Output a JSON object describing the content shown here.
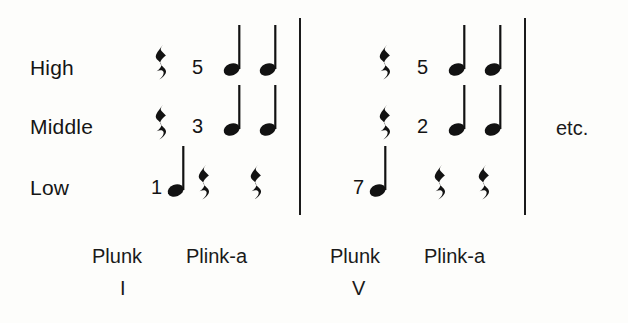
{
  "diagram": {
    "type": "music-notation-accompaniment-pattern",
    "voice_labels": [
      {
        "text": "High",
        "x": 30,
        "y": 57
      },
      {
        "text": "Middle",
        "x": 30,
        "y": 116
      },
      {
        "text": "Low",
        "x": 30,
        "y": 177
      }
    ],
    "measures": [
      {
        "index": 1,
        "chord": "I",
        "rows": [
          {
            "voice": "High",
            "symbols": [
              {
                "kind": "rest",
                "x": 153,
                "y": 44
              },
              {
                "kind": "degree",
                "text": "5",
                "x": 192,
                "y": 57
              },
              {
                "kind": "note",
                "x": 222,
                "y": 25
              },
              {
                "kind": "note",
                "x": 258,
                "y": 25
              }
            ]
          },
          {
            "voice": "Middle",
            "symbols": [
              {
                "kind": "rest",
                "x": 153,
                "y": 104
              },
              {
                "kind": "degree",
                "text": "3",
                "x": 192,
                "y": 116
              },
              {
                "kind": "note",
                "x": 222,
                "y": 85
              },
              {
                "kind": "note",
                "x": 258,
                "y": 85
              }
            ]
          },
          {
            "voice": "Low",
            "symbols": [
              {
                "kind": "degree",
                "text": "1",
                "x": 151,
                "y": 177
              },
              {
                "kind": "note",
                "x": 166,
                "y": 146
              },
              {
                "kind": "rest",
                "x": 196,
                "y": 164
              },
              {
                "kind": "rest",
                "x": 248,
                "y": 164
              }
            ]
          }
        ]
      },
      {
        "index": 2,
        "chord": "V",
        "rows": [
          {
            "voice": "High",
            "symbols": [
              {
                "kind": "rest",
                "x": 377,
                "y": 44
              },
              {
                "kind": "degree",
                "text": "5",
                "x": 417,
                "y": 57
              },
              {
                "kind": "note",
                "x": 447,
                "y": 25
              },
              {
                "kind": "note",
                "x": 483,
                "y": 25
              }
            ]
          },
          {
            "voice": "Middle",
            "symbols": [
              {
                "kind": "rest",
                "x": 377,
                "y": 104
              },
              {
                "kind": "degree",
                "text": "2",
                "x": 417,
                "y": 116
              },
              {
                "kind": "note",
                "x": 447,
                "y": 85
              },
              {
                "kind": "note",
                "x": 483,
                "y": 85
              }
            ]
          },
          {
            "voice": "Low",
            "symbols": [
              {
                "kind": "degree",
                "text": "7",
                "x": 353,
                "y": 177
              },
              {
                "kind": "note",
                "x": 368,
                "y": 146
              },
              {
                "kind": "rest",
                "x": 432,
                "y": 164
              },
              {
                "kind": "rest",
                "x": 476,
                "y": 164
              }
            ]
          }
        ]
      }
    ],
    "barlines": [
      {
        "x": 299,
        "y": 18,
        "height": 197
      },
      {
        "x": 524,
        "y": 18,
        "height": 197
      }
    ],
    "syllables": [
      {
        "text": "Plunk",
        "x": 92,
        "y": 246
      },
      {
        "text": "Plink-a",
        "x": 186,
        "y": 246
      },
      {
        "text": "Plunk",
        "x": 330,
        "y": 246
      },
      {
        "text": "Plink-a",
        "x": 424,
        "y": 246
      }
    ],
    "roman_numerals": [
      {
        "text": "I",
        "x": 120,
        "y": 278
      },
      {
        "text": "V",
        "x": 352,
        "y": 278
      }
    ],
    "continuation": {
      "text": "etc.",
      "x": 556,
      "y": 118
    },
    "colors": {
      "ink": "#141414",
      "background": "#fdfdfb"
    }
  }
}
